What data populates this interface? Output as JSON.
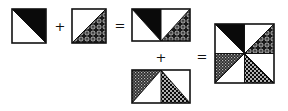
{
  "figure": {
    "colors": {
      "ink": "#111111",
      "background": "#ffffff",
      "black_fill": "#0a0a0a"
    },
    "operators": [
      {
        "symbol": "+",
        "x": 60,
        "y": 26
      },
      {
        "symbol": "=",
        "x": 120,
        "y": 25
      },
      {
        "symbol": "+",
        "x": 161,
        "y": 57
      },
      {
        "symbol": "=",
        "x": 202,
        "y": 56
      }
    ],
    "pieces": [
      {
        "name": "unit-black",
        "x": 12,
        "y": 9,
        "w": 34,
        "h": 34,
        "triangles": [
          {
            "fill": "black",
            "corner": "top-right"
          }
        ]
      },
      {
        "name": "unit-paisley",
        "x": 72,
        "y": 9,
        "w": 34,
        "h": 34,
        "triangles": [
          {
            "fill": "paisley",
            "corner": "bottom-right"
          }
        ]
      },
      {
        "name": "rect-top",
        "x": 132,
        "y": 9,
        "w": 58,
        "h": 32,
        "triangles": [
          {
            "fill": "black",
            "corner": "top-right",
            "half": "left"
          },
          {
            "fill": "paisley",
            "corner": "bottom-right",
            "half": "right"
          }
        ]
      },
      {
        "name": "rect-bottom",
        "x": 132,
        "y": 70,
        "w": 58,
        "h": 33,
        "triangles": [
          {
            "fill": "checker",
            "corner": "top-left",
            "half": "left"
          },
          {
            "fill": "dots",
            "corner": "bottom-left",
            "half": "right"
          }
        ]
      },
      {
        "name": "pinwheel-block",
        "x": 215,
        "y": 24,
        "w": 59,
        "h": 59,
        "quadrants": [
          {
            "pos": "top-left",
            "fill": "black",
            "corner": "top-right"
          },
          {
            "pos": "top-right",
            "fill": "paisley",
            "corner": "bottom-right"
          },
          {
            "pos": "bottom-left",
            "fill": "checker",
            "corner": "top-left"
          },
          {
            "pos": "bottom-right",
            "fill": "dots",
            "corner": "bottom-left"
          }
        ]
      }
    ]
  }
}
